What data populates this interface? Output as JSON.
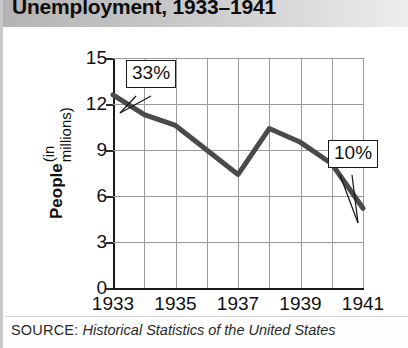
{
  "header": {
    "title": "Unemployment, 1933–1941"
  },
  "axis": {
    "y_title_main": "People",
    "y_title_sub": "(in millions)",
    "y_ticks": [
      "0",
      "3",
      "6",
      "9",
      "12",
      "15"
    ],
    "x_ticks": [
      "1933",
      "1935",
      "1937",
      "1939",
      "1941"
    ]
  },
  "callouts": [
    {
      "name": "start-callout",
      "label": "33%"
    },
    {
      "name": "end-callout",
      "label": "10%"
    }
  ],
  "source": {
    "label": "SOURCE:",
    "text": "Historical Statistics of the United States"
  },
  "colors": {
    "line": "#4a4a4a",
    "grid": "#9a9a9a",
    "axis": "#1a1a1a",
    "header_start": "#b4b4b4",
    "header_end": "#ededed",
    "text": "#111111"
  },
  "chart_data": {
    "type": "line",
    "title": "Unemployment, 1933–1941",
    "xlabel": "",
    "ylabel": "People (in millions)",
    "x": [
      1933,
      1934,
      1935,
      1936,
      1937,
      1938,
      1939,
      1940,
      1941
    ],
    "values": [
      12.6,
      11.3,
      10.6,
      9.0,
      7.4,
      10.4,
      9.5,
      8.1,
      5.2
    ],
    "xlim": [
      1933,
      1941
    ],
    "ylim": [
      0,
      15
    ],
    "ytick_values": [
      0,
      3,
      6,
      9,
      12,
      15
    ],
    "xtick_values": [
      1933,
      1935,
      1937,
      1939,
      1941
    ],
    "grid": true,
    "legend": "none",
    "annotations": [
      {
        "label": "33%",
        "at_x": 1933,
        "at_y": 12.6
      },
      {
        "label": "10%",
        "at_x": 1941,
        "at_y": 5.2
      }
    ],
    "source": "SOURCE: Historical Statistics of the United States"
  }
}
